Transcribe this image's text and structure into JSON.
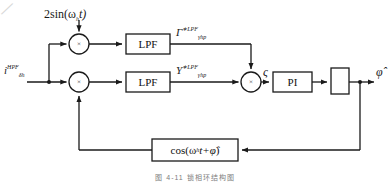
{
  "figure": {
    "type": "block-diagram",
    "title": "",
    "caption": "图 4-11  锁相环结构图",
    "background": "#ffffff",
    "line_color": "#1a1a1a",
    "text_color": "#1a1a1a"
  },
  "signals": {
    "modulation_top": "2sin(ω",
    "modulation_top_sub": "h",
    "modulation_top_tail": "t)",
    "input_base": "i",
    "input_sup": "HPF",
    "input_sub": "δh",
    "gamma_base": "Γ",
    "gamma_sup": "∗LPF",
    "gamma_sub": "γhp",
    "upsilon_base": "Υ",
    "upsilon_sup": "∗LPF",
    "upsilon_sub": "γhp",
    "zeta": "ς",
    "output": "φ̂"
  },
  "blocks": [
    {
      "id": "lpf-top",
      "label": "LPF",
      "shape": "rect",
      "x": 126,
      "y": 34,
      "w": 44,
      "h": 20
    },
    {
      "id": "lpf-bottom",
      "label": "LPF",
      "shape": "rect",
      "x": 126,
      "y": 72,
      "w": 44,
      "h": 20
    },
    {
      "id": "pi",
      "label": "PI",
      "shape": "rect",
      "x": 273,
      "y": 72,
      "w": 39,
      "h": 20
    },
    {
      "id": "integrator",
      "label": "",
      "shape": "rect-narrow",
      "x": 331,
      "y": 68,
      "w": 18,
      "h": 26
    },
    {
      "id": "cos-feedback",
      "label": "cos(ω",
      "label_sub": "h",
      "label_mid": "t+",
      "label_hat": "φ̂",
      "label_end": ")",
      "shape": "rect",
      "x": 152,
      "y": 139,
      "w": 86,
      "h": 22
    }
  ],
  "nodes": [
    {
      "id": "multiplier-top",
      "glyph": "×",
      "shape": "circle",
      "cx": 79,
      "cy": 44,
      "r": 10
    },
    {
      "id": "multiplier-bottom",
      "glyph": "×",
      "shape": "circle",
      "cx": 79,
      "cy": 82,
      "r": 10
    },
    {
      "id": "summing-junction",
      "glyph": "×",
      "shape": "circle",
      "cx": 251,
      "cy": 82,
      "r": 10
    },
    {
      "id": "branch-point-input",
      "shape": "dot",
      "cx": 49,
      "cy": 82,
      "r": 2
    },
    {
      "id": "branch-point-output",
      "shape": "dot",
      "cx": 360,
      "cy": 82,
      "r": 2
    }
  ],
  "annotations": {
    "scan_artifact": "/"
  }
}
